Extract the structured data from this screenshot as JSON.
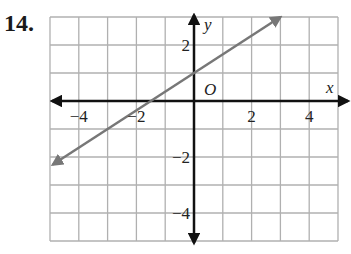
{
  "problem": {
    "number": "14."
  },
  "graph": {
    "x_range": [
      -5,
      5
    ],
    "y_range": [
      -5,
      3
    ],
    "grid_step": 1,
    "axis_labels": {
      "x": "x",
      "y": "y",
      "origin": "O"
    },
    "x_tick_labels": [
      {
        "value": -4,
        "text": "−4"
      },
      {
        "value": -2,
        "text": "−2"
      },
      {
        "value": 2,
        "text": "2"
      },
      {
        "value": 4,
        "text": "4"
      }
    ],
    "y_tick_labels": [
      {
        "value": 2,
        "text": "2"
      },
      {
        "value": -2,
        "text": "−2"
      },
      {
        "value": -4,
        "text": "−4"
      }
    ],
    "line": {
      "description": "line y = (2/3)x + 1",
      "slope": 0.6667,
      "y_intercept": 1,
      "x_intercept": -1.5,
      "start": [
        -4.9,
        -2.27
      ],
      "end": [
        3,
        3
      ],
      "color": "#777777"
    },
    "colors": {
      "grid": "#b0b0b0",
      "axis": "#111111",
      "line": "#777777"
    }
  },
  "chart_data": {
    "type": "line",
    "title": "",
    "xlabel": "x",
    "ylabel": "y",
    "x": [
      -4.9,
      -1.5,
      0,
      3
    ],
    "series": [
      {
        "name": "y = (2/3)x + 1",
        "values": [
          -2.27,
          0,
          1,
          3
        ]
      }
    ],
    "xlim": [
      -5,
      5
    ],
    "ylim": [
      -5,
      3
    ],
    "x_ticks": [
      -4,
      -2,
      2,
      4
    ],
    "y_ticks": [
      -4,
      -2,
      2
    ],
    "grid": true
  }
}
